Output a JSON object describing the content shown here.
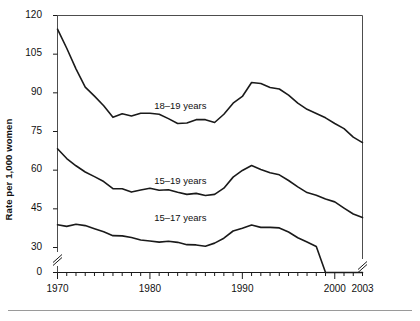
{
  "chart_data": {
    "type": "line",
    "title": "",
    "subtitle": "",
    "xlabel": "",
    "ylabel": "Rate per 1,000 women",
    "xlim": [
      1970,
      2003
    ],
    "ylim": [
      0,
      120
    ],
    "yticks": [
      0,
      30,
      45,
      60,
      75,
      90,
      105,
      120
    ],
    "ytick_labels": [
      "0",
      "30",
      "45",
      "60",
      "75",
      "90",
      "105",
      "120"
    ],
    "y_axis_break": {
      "below": 30,
      "above": 0,
      "note": "axis break between 0 and 30"
    },
    "xticks": [
      1970,
      1980,
      1990,
      2000,
      2003
    ],
    "xtick_labels": [
      "1970",
      "1980",
      "1990",
      "2000",
      "2003"
    ],
    "minor_xticks_every": 1,
    "grid": false,
    "legend_position": "inline-labels",
    "x": [
      1970,
      1971,
      1972,
      1973,
      1974,
      1975,
      1976,
      1977,
      1978,
      1979,
      1980,
      1981,
      1982,
      1983,
      1984,
      1985,
      1986,
      1987,
      1988,
      1989,
      1990,
      1991,
      1992,
      1993,
      1994,
      1995,
      1996,
      1997,
      1998,
      1999,
      2000,
      2001,
      2002,
      2003
    ],
    "series": [
      {
        "name": "18–19 years",
        "label": "18–19 years",
        "color": "#1a1a1a",
        "values": [
          114.7,
          107.3,
          99.3,
          92.2,
          88.7,
          85.0,
          80.5,
          81.9,
          81.0,
          82.1,
          82.1,
          81.7,
          80.0,
          78.1,
          78.3,
          79.6,
          79.6,
          78.5,
          81.7,
          86.0,
          88.6,
          94.0,
          93.6,
          92.1,
          91.5,
          89.1,
          86.0,
          83.6,
          82.0,
          80.3,
          78.1,
          76.1,
          72.8,
          70.7
        ]
      },
      {
        "name": "15–19 years",
        "label": "15–19 years",
        "color": "#1a1a1a",
        "values": [
          68.3,
          64.5,
          61.7,
          59.3,
          57.5,
          55.6,
          52.8,
          52.8,
          51.5,
          52.3,
          53.0,
          52.2,
          52.4,
          51.4,
          50.6,
          51.0,
          50.2,
          50.6,
          53.0,
          57.3,
          59.9,
          61.8,
          60.3,
          59.0,
          58.2,
          56.0,
          53.5,
          51.3,
          50.3,
          48.8,
          47.7,
          45.3,
          43.0,
          41.6
        ]
      },
      {
        "name": "15–17 years",
        "label": "15–17 years",
        "color": "#1a1a1a",
        "values": [
          38.8,
          38.2,
          39.0,
          38.5,
          37.3,
          36.1,
          34.6,
          34.5,
          33.9,
          32.9,
          32.5,
          32.1,
          32.4,
          32.0,
          31.1,
          31.0,
          30.5,
          31.7,
          33.6,
          36.4,
          37.5,
          38.7,
          37.8,
          37.8,
          37.6,
          36.0,
          33.8,
          32.1,
          30.4,
          28.7,
          26.9,
          24.7,
          23.2,
          22.4
        ]
      }
    ],
    "annotations": [
      {
        "text": "18–19 years",
        "x": 1983.6,
        "y": 84.5
      },
      {
        "text": "15–19 years",
        "x": 1983.6,
        "y": 55.5
      },
      {
        "text": "15–17 years",
        "x": 1983.6,
        "y": 41.0
      }
    ]
  },
  "axis": {
    "y_title": "Rate per 1,000 women"
  }
}
